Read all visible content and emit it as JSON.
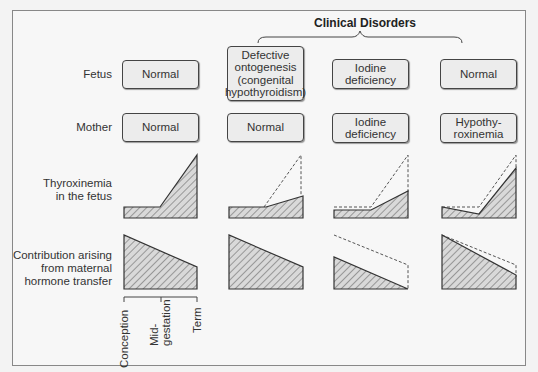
{
  "header": {
    "title": "Clinical Disorders"
  },
  "row_labels": {
    "fetus": "Fetus",
    "mother": "Mother",
    "thyroxinemia": "Thyroxinemia\nin the fetus",
    "contribution": "Contribution arising\nfrom maternal\nhormone transfer"
  },
  "columns": [
    {
      "fetus": "Normal",
      "mother": "Normal"
    },
    {
      "fetus": "Defective\nontogenesis\n(congenital\nhypothyroidism)",
      "mother": "Normal"
    },
    {
      "fetus": "Iodine\ndeficiency",
      "mother": "Iodine\ndeficiency"
    },
    {
      "fetus": "Normal",
      "mother": "Hypothy-\nroxinemia"
    }
  ],
  "axis": {
    "ticks": [
      "Conception",
      "Mid-\ngestation",
      "Term"
    ]
  },
  "colors": {
    "outline": "#333333",
    "hatch": "#555555",
    "fill": "#d8d8d8",
    "dashed": "#555555"
  }
}
